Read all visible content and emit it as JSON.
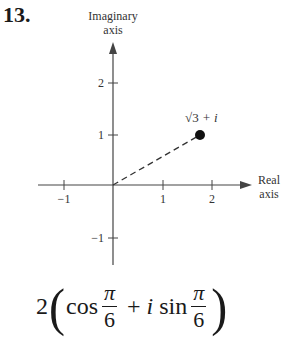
{
  "problem": {
    "number": "13."
  },
  "diagram": {
    "y_axis_label_line1": "Imaginary",
    "y_axis_label_line2": "axis",
    "x_axis_label_line1": "Real",
    "x_axis_label_line2": "axis",
    "x_ticks": [
      "−1",
      "1",
      "2"
    ],
    "y_ticks": [
      "2",
      "1",
      "−1"
    ],
    "point_label_radical": "√3",
    "point_label_rest": " + i",
    "point": {
      "re": 1.732,
      "im": 1
    }
  },
  "formula": {
    "coefficient": "2",
    "open_paren": "(",
    "cos": "cos",
    "numerator1": "π",
    "denominator1": "6",
    "plus": "+",
    "i": "i",
    "sin": "sin",
    "numerator2": "π",
    "denominator2": "6",
    "close_paren": ")"
  }
}
